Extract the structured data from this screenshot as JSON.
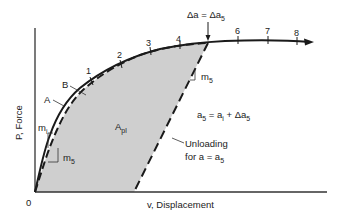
{
  "figure": {
    "type": "load-displacement-diagram",
    "colors": {
      "ink": "#1a1a1a",
      "shade": "#cfcfcf",
      "background": "#ffffff"
    },
    "axes": {
      "origin_label": "0",
      "y_label": "P, Force",
      "x_label": "v, Displacement"
    },
    "curves": {
      "A_label": "A",
      "B_label": "B",
      "solid": "loading curve A (solid)",
      "dashed": "loading curve B (dashed)",
      "unloading": "unloading line (dashed)"
    },
    "tick_labels": [
      "1",
      "2",
      "3",
      "4",
      "6",
      "7",
      "8"
    ],
    "annotations": {
      "delta_a": "Δa = Δa",
      "delta_a_sub": "5",
      "m_i": "m",
      "m_i_sub": "i",
      "m5_upper": "m",
      "m5_upper_sub": "5",
      "m5_lower": "m",
      "m5_lower_sub": "5",
      "area": "A",
      "area_sub": "pl",
      "equation_a": "a",
      "equation_a_sub": "5",
      "equation_mid": " = a",
      "equation_mid_sub": "i",
      "equation_plus": " + Δa",
      "equation_end_sub": "5",
      "unloading_line1": "Unloading",
      "unloading_line2": "for a = a",
      "unloading_line2_sub": "5"
    }
  }
}
